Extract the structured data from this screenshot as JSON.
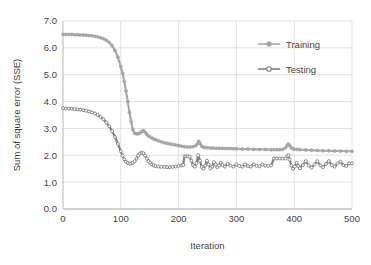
{
  "chart_data": {
    "type": "line",
    "title": "",
    "xlabel": "Iteration",
    "ylabel": "Sum of square error (SSE)",
    "xlim": [
      0,
      500
    ],
    "ylim": [
      0,
      7
    ],
    "xticks": [
      "0",
      "100",
      "200",
      "300",
      "400",
      "500"
    ],
    "yticks": [
      "0.0",
      "1.0",
      "2.0",
      "3.0",
      "4.0",
      "5.0",
      "6.0",
      "7.0"
    ],
    "grid": true,
    "legend_position": "upper-right",
    "legend": [
      {
        "name": "Training",
        "color": "#a6a6a6",
        "marker": "filled-circle"
      },
      {
        "name": "Testing",
        "color": "#808080",
        "marker": "hollow-circle"
      }
    ],
    "series": [
      {
        "name": "Training",
        "color": "#a6a6a6",
        "marker": "filled-circle",
        "x": [
          0,
          5,
          10,
          15,
          20,
          25,
          30,
          35,
          40,
          45,
          50,
          55,
          60,
          65,
          70,
          75,
          80,
          85,
          90,
          95,
          100,
          103,
          106,
          109,
          112,
          115,
          118,
          121,
          124,
          127,
          130,
          133,
          136,
          139,
          142,
          145,
          148,
          151,
          154,
          157,
          160,
          165,
          170,
          175,
          180,
          185,
          190,
          195,
          200,
          205,
          210,
          215,
          220,
          225,
          230,
          233,
          235,
          237,
          240,
          243,
          246,
          250,
          255,
          260,
          265,
          270,
          275,
          280,
          285,
          290,
          295,
          300,
          310,
          320,
          330,
          340,
          350,
          360,
          365,
          370,
          375,
          380,
          385,
          388,
          390,
          392,
          395,
          398,
          400,
          405,
          410,
          420,
          430,
          440,
          450,
          460,
          470,
          480,
          490,
          500
        ],
        "y": [
          6.5,
          6.5,
          6.5,
          6.5,
          6.49,
          6.49,
          6.48,
          6.48,
          6.47,
          6.46,
          6.45,
          6.43,
          6.41,
          6.38,
          6.34,
          6.28,
          6.2,
          6.08,
          5.9,
          5.65,
          5.3,
          5.05,
          4.75,
          4.4,
          4.0,
          3.6,
          3.25,
          2.95,
          2.82,
          2.8,
          2.8,
          2.83,
          2.88,
          2.92,
          2.86,
          2.78,
          2.72,
          2.68,
          2.64,
          2.61,
          2.58,
          2.54,
          2.5,
          2.47,
          2.44,
          2.42,
          2.4,
          2.38,
          2.36,
          2.34,
          2.32,
          2.31,
          2.31,
          2.32,
          2.36,
          2.44,
          2.52,
          2.44,
          2.34,
          2.3,
          2.29,
          2.28,
          2.27,
          2.27,
          2.26,
          2.26,
          2.26,
          2.25,
          2.25,
          2.25,
          2.24,
          2.24,
          2.23,
          2.23,
          2.22,
          2.22,
          2.22,
          2.21,
          2.21,
          2.21,
          2.21,
          2.22,
          2.28,
          2.36,
          2.42,
          2.36,
          2.28,
          2.24,
          2.23,
          2.22,
          2.21,
          2.2,
          2.19,
          2.18,
          2.17,
          2.17,
          2.16,
          2.16,
          2.15,
          2.15
        ]
      },
      {
        "name": "Testing",
        "color": "#7f7f7f",
        "marker": "hollow-circle",
        "x": [
          0,
          5,
          10,
          15,
          20,
          25,
          30,
          35,
          40,
          45,
          50,
          55,
          60,
          65,
          70,
          75,
          80,
          85,
          90,
          95,
          100,
          103,
          106,
          109,
          112,
          115,
          118,
          121,
          124,
          127,
          130,
          133,
          136,
          139,
          142,
          145,
          148,
          151,
          154,
          157,
          160,
          165,
          170,
          175,
          180,
          185,
          190,
          195,
          200,
          205,
          208,
          210,
          213,
          216,
          219,
          222,
          225,
          228,
          231,
          234,
          237,
          240,
          243,
          246,
          249,
          252,
          255,
          258,
          261,
          264,
          267,
          270,
          273,
          276,
          280,
          285,
          290,
          295,
          300,
          305,
          310,
          315,
          320,
          325,
          330,
          335,
          340,
          345,
          350,
          355,
          360,
          365,
          370,
          375,
          380,
          385,
          388,
          390,
          392,
          395,
          398,
          401,
          404,
          407,
          410,
          415,
          420,
          425,
          430,
          435,
          440,
          445,
          450,
          455,
          460,
          465,
          470,
          475,
          480,
          485,
          490,
          495,
          500
        ],
        "y": [
          3.75,
          3.74,
          3.74,
          3.73,
          3.72,
          3.71,
          3.7,
          3.68,
          3.66,
          3.63,
          3.6,
          3.56,
          3.5,
          3.43,
          3.34,
          3.22,
          3.08,
          2.9,
          2.68,
          2.42,
          2.15,
          1.98,
          1.85,
          1.76,
          1.71,
          1.69,
          1.7,
          1.72,
          1.78,
          1.88,
          1.99,
          2.06,
          2.1,
          2.08,
          1.99,
          1.88,
          1.78,
          1.72,
          1.66,
          1.62,
          1.6,
          1.58,
          1.57,
          1.57,
          1.56,
          1.56,
          1.57,
          1.58,
          1.6,
          1.62,
          1.64,
          1.96,
          1.96,
          1.96,
          1.95,
          1.8,
          1.64,
          1.58,
          1.7,
          2.0,
          1.8,
          1.56,
          1.5,
          1.62,
          1.8,
          1.66,
          1.52,
          1.58,
          1.74,
          1.66,
          1.56,
          1.62,
          1.72,
          1.64,
          1.58,
          1.68,
          1.62,
          1.58,
          1.66,
          1.6,
          1.58,
          1.66,
          1.6,
          1.58,
          1.66,
          1.61,
          1.59,
          1.66,
          1.61,
          1.6,
          1.62,
          1.88,
          1.88,
          1.88,
          1.88,
          1.88,
          1.96,
          2.0,
          1.84,
          1.62,
          1.5,
          1.58,
          1.72,
          1.6,
          1.52,
          1.64,
          1.78,
          1.62,
          1.54,
          1.66,
          1.78,
          1.62,
          1.56,
          1.68,
          1.78,
          1.63,
          1.58,
          1.7,
          1.76,
          1.63,
          1.6,
          1.7,
          1.7
        ]
      }
    ]
  },
  "plot_area": {
    "left": 63,
    "top": 21,
    "right": 352,
    "bottom": 209
  }
}
